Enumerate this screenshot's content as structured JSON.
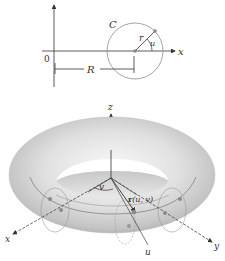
{
  "top_diagram": {
    "origin_label": "0",
    "x_axis_label": "x",
    "circle_label": "C",
    "radius_label": "r",
    "angle_label": "u",
    "distance_label": "R"
  },
  "torus_diagram": {
    "z_axis_label": "z",
    "x_axis_label": "x",
    "y_axis_label": "y",
    "angle_v_label": "v",
    "position_vector_label_bold": "r",
    "position_vector_label_args": "(u, v)",
    "u_axis_label": "u"
  },
  "colors": {
    "line": "#333333",
    "circle": "#999999",
    "torus_light": "#f2f2f2",
    "torus_mid": "#cfcfcf",
    "torus_dark": "#a8a8a8"
  }
}
